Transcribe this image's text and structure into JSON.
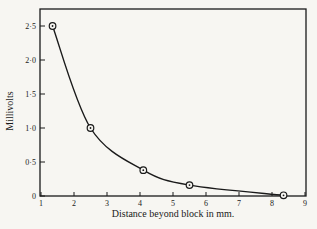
{
  "chart_data": {
    "type": "line",
    "title": "",
    "xlabel": "Distance beyond block in mm.",
    "ylabel": "Millivolts",
    "xlim": [
      1,
      9
    ],
    "ylim": [
      0,
      2.75
    ],
    "x_ticks": [
      1,
      2,
      3,
      4,
      5,
      6,
      7,
      8,
      9
    ],
    "x_tick_labels": [
      "1",
      "2",
      "3",
      "4",
      "5",
      "6",
      "7",
      "8",
      "9"
    ],
    "y_ticks": [
      0,
      0.5,
      1.0,
      1.5,
      2.0,
      2.5
    ],
    "y_tick_labels": [
      "0",
      "0·5",
      "1·0",
      "1·5",
      "2·0",
      "2·5"
    ],
    "grid": false,
    "legend": null,
    "series": [
      {
        "name": "Millivolts vs distance",
        "marker": "circle-dot",
        "smooth": true,
        "x": [
          1.35,
          2.5,
          4.1,
          5.5,
          8.35
        ],
        "y": [
          2.5,
          1.0,
          0.38,
          0.16,
          0.01
        ]
      }
    ]
  },
  "colors": {
    "background": "#f7f6f2",
    "ink": "#1a1a1a"
  }
}
